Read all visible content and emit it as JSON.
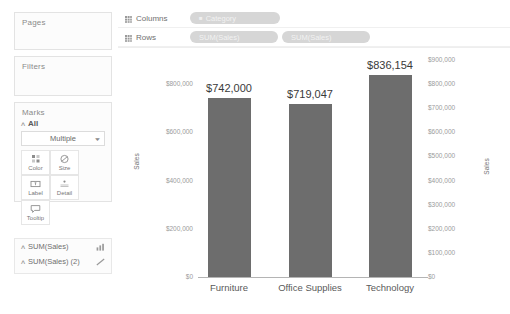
{
  "left_panel": {
    "pages": {
      "title": "Pages"
    },
    "filters": {
      "title": "Filters"
    },
    "marks": {
      "title": "Marks",
      "all_label": "All",
      "mark_type": "Multiple",
      "buttons": [
        {
          "label": "Color",
          "icon": "color-icon"
        },
        {
          "label": "Size",
          "icon": "size-icon"
        },
        {
          "label": "Label",
          "icon": "label-icon"
        },
        {
          "label": "Detail",
          "icon": "detail-icon"
        },
        {
          "label": "Tooltip",
          "icon": "tooltip-icon"
        }
      ]
    },
    "measures": [
      {
        "name": "SUM(Sales)",
        "icon": "bar-chart-icon"
      },
      {
        "name": "SUM(Sales) (2)",
        "icon": "line-chart-icon"
      }
    ]
  },
  "shelves": {
    "columns": {
      "label": "Columns",
      "pills": [
        {
          "text": "Category",
          "icon": "dimension-icon"
        }
      ]
    },
    "rows": {
      "label": "Rows",
      "pills": [
        {
          "text": "SUM(Sales)",
          "icon": "measure-icon"
        },
        {
          "text": "SUM(Sales)",
          "icon": "measure-icon"
        }
      ]
    }
  },
  "chart_data": {
    "type": "bar",
    "title": "",
    "xlabel": "",
    "ylabel": "Sales",
    "ylabel_right": "Sales",
    "categories": [
      "Furniture",
      "Office Supplies",
      "Technology"
    ],
    "values": [
      742000,
      719047,
      836154
    ],
    "value_labels": [
      "$742,000",
      "$719,047",
      "$836,154"
    ],
    "bar_color": "#6d6d6d",
    "grid": false,
    "legend": "none",
    "axis_left": {
      "ylim": [
        0,
        900000
      ],
      "ticks": [
        0,
        200000,
        400000,
        600000,
        800000
      ],
      "tick_labels": [
        "$0",
        "$200,000",
        "$400,000",
        "$600,000",
        "$800,000"
      ]
    },
    "axis_right": {
      "ylim": [
        0,
        900000
      ],
      "ticks": [
        0,
        100000,
        200000,
        300000,
        400000,
        500000,
        600000,
        700000,
        800000,
        900000
      ],
      "tick_labels": [
        "$0",
        "$100,000",
        "$200,000",
        "$300,000",
        "$400,000",
        "$500,000",
        "$600,000",
        "$700,000",
        "$800,000",
        "$900,000"
      ]
    }
  }
}
